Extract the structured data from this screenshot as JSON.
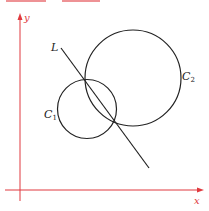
{
  "diagram": {
    "title_fragment": "",
    "colors": {
      "axis": "#e0393e",
      "curve": "#222222"
    },
    "axes": {
      "x_label": "x",
      "y_label": "y"
    },
    "elements": [
      {
        "id": "C1",
        "type": "circle",
        "label": "C",
        "label_sub": "1"
      },
      {
        "id": "C2",
        "type": "circle",
        "label": "C",
        "label_sub": "2"
      },
      {
        "id": "L",
        "type": "line",
        "label": "L"
      }
    ]
  }
}
